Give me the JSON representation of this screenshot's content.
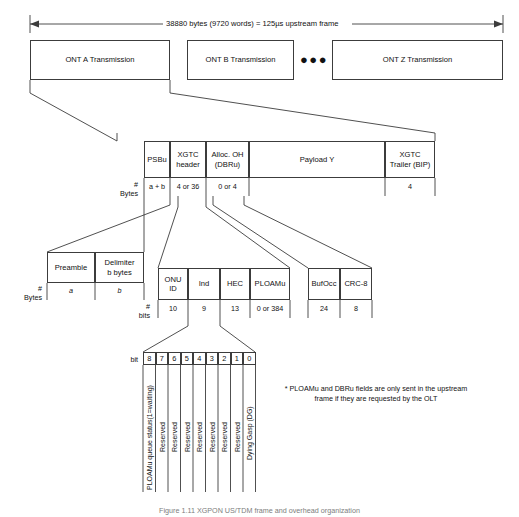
{
  "figure": {
    "top_dimension_label": "38880 bytes (9720 words) = 125µs upstream frame",
    "caption": "Figure 1.11  XGPON US/TDM frame and overhead organization"
  },
  "row1": {
    "boxes": [
      {
        "label": "ONT A Transmission"
      },
      {
        "label": "ONT B Transmission"
      },
      {
        "label": "ONT Z Transmission"
      }
    ],
    "ellipsis": "●●●"
  },
  "row2": {
    "axis_label": "#\nBytes",
    "cells": [
      {
        "label": "PSBu",
        "size": "a + b"
      },
      {
        "label": "XGTC\nheader",
        "size": "4 or 36"
      },
      {
        "label": "Alloc. OH\n(DBRu)",
        "size": "0 or 4"
      },
      {
        "label": "Payload Y",
        "size": ""
      },
      {
        "label": "XGTC\nTrailer (BIP)",
        "size": "4"
      }
    ]
  },
  "row3_psbu": {
    "axis_label": "#\nBytes",
    "cells": [
      {
        "label": "Preamble",
        "size": "a"
      },
      {
        "label": "Delimiter\nb bytes",
        "size": "b"
      }
    ]
  },
  "row3_xgtc": {
    "axis_label": "#\nbits",
    "cells": [
      {
        "label": "ONU\nID",
        "size": "10"
      },
      {
        "label": "Ind",
        "size": "9"
      },
      {
        "label": "HEC",
        "size": "13"
      },
      {
        "label": "PLOAMu",
        "size": "0 or 384"
      }
    ]
  },
  "row3_dbru": {
    "cells": [
      {
        "label": "BufOcc",
        "size": "24"
      },
      {
        "label": "CRC-8",
        "size": "8"
      }
    ]
  },
  "bitfield": {
    "axis_label": "bit",
    "bits": [
      {
        "number": "8",
        "name": "PLOAMu queue status(1=waiting)"
      },
      {
        "number": "7",
        "name": "Reserved"
      },
      {
        "number": "6",
        "name": "Reserved"
      },
      {
        "number": "5",
        "name": "Reserved"
      },
      {
        "number": "4",
        "name": "Reserved"
      },
      {
        "number": "3",
        "name": "Reserved"
      },
      {
        "number": "2",
        "name": "Reserved"
      },
      {
        "number": "1",
        "name": "Reserved"
      },
      {
        "number": "0",
        "name": "Dying Gasp (DG)"
      }
    ]
  },
  "footnote": {
    "text": "* PLOAMu and DBRu fields are only sent in the upstream frame if they are requested by the OLT"
  },
  "colors": {
    "stroke": "#3c3c3c",
    "text": "#111111",
    "background": "#ffffff"
  }
}
